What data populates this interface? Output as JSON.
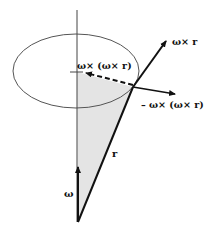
{
  "diagram": {
    "labels": {
      "omega_cross_r": "ω× r",
      "omega_cross_omega_cross_r": "ω× (ω× r)",
      "neg_omega_cross_omega_cross_r": "– ω× (ω× r)",
      "r": "r",
      "omega": "ω"
    },
    "colors": {
      "stroke": "#111111",
      "axis": "#444444",
      "ellipse": "#555555",
      "shade": "#e4e4e4"
    }
  }
}
